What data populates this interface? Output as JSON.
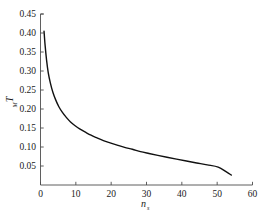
{
  "chart_data": {
    "type": "line",
    "title": "",
    "subtitle": "",
    "xlabel": "n",
    "xlabel_sub": "s",
    "ylabel": "T",
    "ylabel_sub": "M",
    "xlim": [
      0,
      60
    ],
    "ylim": [
      0,
      0.45
    ],
    "grid": false,
    "legend": null,
    "legend_position": "none",
    "xticks": [
      "0",
      "10",
      "20",
      "30",
      "40",
      "50",
      "60"
    ],
    "xtick_values": [
      0,
      10,
      20,
      30,
      40,
      50,
      60
    ],
    "yticks": [
      "0.05",
      "0.10",
      "0.15",
      "0.20",
      "0.25",
      "0.30",
      "0.35",
      "0.40",
      "0.45"
    ],
    "ytick_values": [
      0.05,
      0.1,
      0.15,
      0.2,
      0.25,
      0.3,
      0.35,
      0.4,
      0.45
    ],
    "series": [
      {
        "name": "T_M",
        "color": "#111111",
        "linewidth": 1.4,
        "x": [
          1.0,
          1.3,
          1.7,
          2.2,
          2.8,
          3.5,
          4.3,
          5.2,
          6.2,
          7.3,
          8.5,
          9.8,
          11.2,
          12.7,
          14.3,
          16.0,
          17.8,
          19.7,
          21.7,
          23.8,
          26.0,
          28.3,
          30.7,
          33.2,
          35.8,
          38.5,
          41.3,
          44.2,
          47.2,
          50.3,
          52.5,
          54.0
        ],
        "y": [
          0.405,
          0.368,
          0.33,
          0.295,
          0.268,
          0.244,
          0.224,
          0.206,
          0.191,
          0.178,
          0.166,
          0.156,
          0.147,
          0.139,
          0.131,
          0.124,
          0.117,
          0.111,
          0.105,
          0.099,
          0.094,
          0.088,
          0.083,
          0.078,
          0.073,
          0.068,
          0.063,
          0.058,
          0.053,
          0.047,
          0.035,
          0.026
        ]
      }
    ]
  },
  "axes": {
    "spine_color": "#4d4d4d",
    "tick_color": "#4d4d4d",
    "background": "#ffffff"
  }
}
